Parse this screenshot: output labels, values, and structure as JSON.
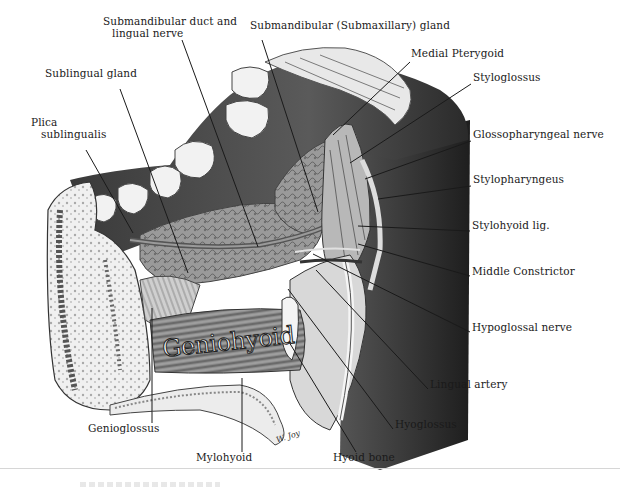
{
  "figure": {
    "type": "anatomical-illustration",
    "embedded_text": {
      "muscle_script": "Geniohyoid",
      "artist_signature": "W. Joy"
    }
  },
  "labels": [
    {
      "id": "submandibular-duct",
      "text": "Submandibular duct and",
      "x": 103,
      "y": 24
    },
    {
      "id": "submandibular-duct-2",
      "text": "lingual nerve",
      "x": 112,
      "y": 36
    },
    {
      "id": "submandibular-gland",
      "text": "Submandibular (Submaxillary) gland",
      "x": 250,
      "y": 28
    },
    {
      "id": "medial-pterygoid",
      "text": "Medial Pterygoid",
      "x": 411,
      "y": 56
    },
    {
      "id": "sublingual-gland",
      "text": "Sublingual gland",
      "x": 45,
      "y": 76
    },
    {
      "id": "styloglossus",
      "text": "Styloglossus",
      "x": 473,
      "y": 80
    },
    {
      "id": "plica",
      "text": "Plica",
      "x": 31,
      "y": 125
    },
    {
      "id": "plica-2",
      "text": "sublingualis",
      "x": 41,
      "y": 137
    },
    {
      "id": "glossopharyngeal",
      "text": "Glossopharyngeal nerve",
      "x": 473,
      "y": 137
    },
    {
      "id": "stylopharyngeus",
      "text": "Stylopharyngeus",
      "x": 473,
      "y": 182
    },
    {
      "id": "stylohyoid",
      "text": "Stylohyoid lig.",
      "x": 472,
      "y": 228
    },
    {
      "id": "middle-constrictor",
      "text": "Middle Constrictor",
      "x": 472,
      "y": 274
    },
    {
      "id": "hypoglossal",
      "text": "Hypoglossal nerve",
      "x": 472,
      "y": 330
    },
    {
      "id": "lingual-artery",
      "text": "Lingual artery",
      "x": 430,
      "y": 387
    },
    {
      "id": "hyoglossus",
      "text": "Hyoglossus",
      "x": 395,
      "y": 427
    },
    {
      "id": "genioglossus",
      "text": "Genioglossus",
      "x": 88,
      "y": 431
    },
    {
      "id": "mylohyoid",
      "text": "Mylohyoid",
      "x": 196,
      "y": 460
    },
    {
      "id": "hyoid-bone",
      "text": "Hyoid bone",
      "x": 333,
      "y": 460
    }
  ],
  "leaders": [
    {
      "id": "submandibular-duct",
      "x1": 182,
      "y1": 40,
      "x2": 258,
      "y2": 247
    },
    {
      "id": "submandibular-gland",
      "x1": 262,
      "y1": 40,
      "x2": 318,
      "y2": 212
    },
    {
      "id": "medial-pterygoid",
      "x1": 410,
      "y1": 62,
      "x2": 333,
      "y2": 135
    },
    {
      "id": "sublingual-gland",
      "x1": 120,
      "y1": 89,
      "x2": 188,
      "y2": 273
    },
    {
      "id": "styloglossus",
      "x1": 471,
      "y1": 84,
      "x2": 350,
      "y2": 163
    },
    {
      "id": "plica",
      "x1": 86,
      "y1": 150,
      "x2": 133,
      "y2": 233
    },
    {
      "id": "glossopharyngeal",
      "x1": 471,
      "y1": 141,
      "x2": 365,
      "y2": 179
    },
    {
      "id": "stylopharyngeus",
      "x1": 471,
      "y1": 186,
      "x2": 378,
      "y2": 199
    },
    {
      "id": "stylohyoid",
      "x1": 470,
      "y1": 231,
      "x2": 358,
      "y2": 226
    },
    {
      "id": "middle-constrictor",
      "x1": 470,
      "y1": 276,
      "x2": 358,
      "y2": 244
    },
    {
      "id": "hypoglossal",
      "x1": 470,
      "y1": 332,
      "x2": 313,
      "y2": 254
    },
    {
      "id": "lingual-artery",
      "x1": 428,
      "y1": 389,
      "x2": 316,
      "y2": 270
    },
    {
      "id": "hyoglossus",
      "x1": 393,
      "y1": 429,
      "x2": 288,
      "y2": 289
    },
    {
      "id": "genioglossus",
      "x1": 152,
      "y1": 423,
      "x2": 152,
      "y2": 308
    },
    {
      "id": "mylohyoid",
      "x1": 242,
      "y1": 452,
      "x2": 242,
      "y2": 378
    },
    {
      "id": "hyoid-bone",
      "x1": 356,
      "y1": 452,
      "x2": 289,
      "y2": 342
    }
  ],
  "colors": {
    "ink": "#1a1a1a",
    "dark_tissue": "#3a3a3a",
    "mid_tissue": "#7a7a7a",
    "light_tissue": "#c8c8c8",
    "bone": "#eeeeee",
    "background": "#ffffff"
  }
}
